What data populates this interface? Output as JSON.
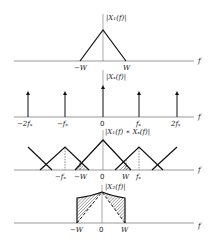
{
  "panels": [
    {
      "id": "signal-spectrum",
      "ylabel": "|X₁(f)|",
      "xlabel": "f",
      "ticks": [
        "−W",
        "W"
      ]
    },
    {
      "id": "sampling-impulses",
      "ylabel": "|Xₛ(f)|",
      "xlabel": "f",
      "ticks": [
        "−2fₛ",
        "−fₛ",
        "0",
        "fₛ",
        "2fₛ"
      ]
    },
    {
      "id": "convolution-spectrum",
      "ylabel": "|X₁(f) ∗ Xₛ(f)|",
      "xlabel": "f",
      "ticks": [
        "−fₛ",
        "−W",
        "0",
        "W",
        "fₛ"
      ]
    },
    {
      "id": "aliased-spectrum",
      "ylabel": "|X₂(f)|",
      "xlabel": "f",
      "ticks": [
        "−W",
        "0",
        "W"
      ]
    }
  ]
}
